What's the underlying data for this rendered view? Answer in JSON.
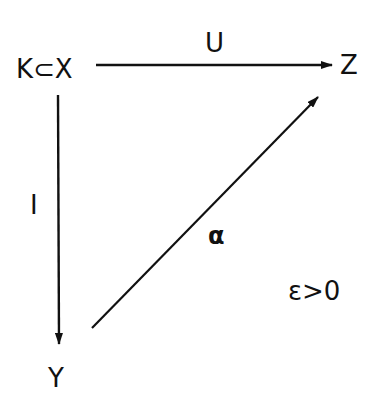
{
  "diagram": {
    "type": "commutative-diagram",
    "nodes": {
      "top_left": "K⊂X",
      "top_right": "Z",
      "bottom_left": "Y"
    },
    "arrows": {
      "top": {
        "label": "U",
        "from": "K⊂X",
        "to": "Z"
      },
      "left": {
        "label": "I",
        "from": "K⊂X",
        "to": "Y"
      },
      "diagonal": {
        "label": "α",
        "from": "Y",
        "to": "Z"
      }
    },
    "condition": "ε>0",
    "colors": {
      "ink": "#111111",
      "background": "#ffffff"
    }
  }
}
